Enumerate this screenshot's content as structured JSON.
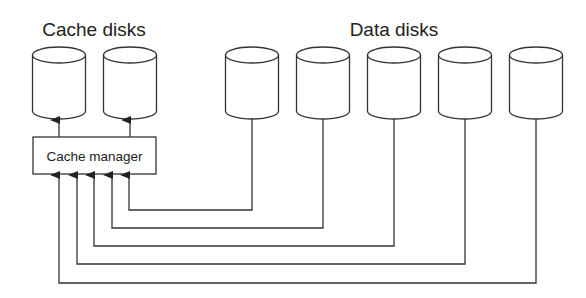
{
  "labels": {
    "cache_disks": "Cache disks",
    "data_disks": "Data disks",
    "cache_manager": "Cache manager"
  },
  "colors": {
    "stroke": "#333333",
    "text": "#222222",
    "background": "#ffffff"
  },
  "cache_disks": [
    {
      "id": "cache-disk-1",
      "cx": 59
    },
    {
      "id": "cache-disk-2",
      "cx": 130
    }
  ],
  "data_disks": [
    {
      "id": "data-disk-1",
      "cx": 252,
      "arrow_x": 129,
      "line_y": 210
    },
    {
      "id": "data-disk-2",
      "cx": 323,
      "arrow_x": 112,
      "line_y": 228
    },
    {
      "id": "data-disk-3",
      "cx": 394,
      "arrow_x": 94,
      "line_y": 246
    },
    {
      "id": "data-disk-4",
      "cx": 465,
      "arrow_x": 77,
      "line_y": 264
    },
    {
      "id": "data-disk-5",
      "cx": 536,
      "arrow_x": 59,
      "line_y": 283
    }
  ]
}
